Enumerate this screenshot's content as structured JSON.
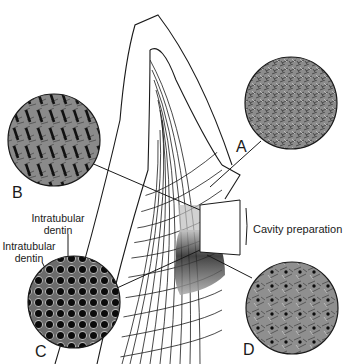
{
  "figure": {
    "insets": [
      {
        "id": "A",
        "label": "A",
        "pattern": "sparse tubules, mineralized texture"
      },
      {
        "id": "B",
        "label": "B",
        "pattern": "oblique elongated tubules"
      },
      {
        "id": "C",
        "label": "C",
        "pattern": "dense large tubules with intratubular dentin rings"
      },
      {
        "id": "D",
        "label": "D",
        "pattern": "sparse occluded tubules"
      }
    ],
    "annotations": {
      "cavity": "Cavity preparation",
      "intratubular_1": "Intratubular\ndentin",
      "intratubular_2": "Intratubular\ndentin"
    },
    "colors": {
      "line": "#1a1a1a",
      "inset_fill": "#8a8a8a",
      "background": "#ffffff"
    }
  }
}
